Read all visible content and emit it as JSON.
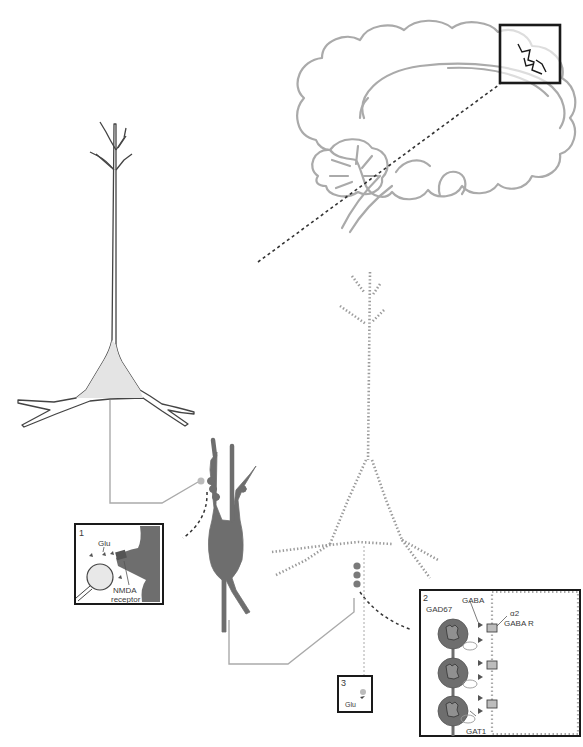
{
  "figure": {
    "colors": {
      "outline_gray": "#a9a9a9",
      "dark_neuron": "#6e6e6e",
      "soma_fill": "#e6e6e6",
      "box_border": "#1a1a1a",
      "dotted_neuron": "#9a9a9a",
      "axon_gray": "#9e9e9e"
    }
  },
  "brain_inset": {
    "label": "",
    "highlight_box": "prefrontal-cortex-region"
  },
  "insets": {
    "inset1": {
      "number": "1",
      "glu_label": "Glu",
      "nmda_label": "NMDA",
      "receptor_label": "receptor"
    },
    "inset2": {
      "number": "2",
      "gad67_label": "GAD67",
      "gaba_label": "GABA",
      "alpha2_label": "α2",
      "gabar_label": "GABA R",
      "gat1_label": "GAT1"
    },
    "inset3": {
      "number": "3",
      "glu_label": "Glu"
    }
  }
}
